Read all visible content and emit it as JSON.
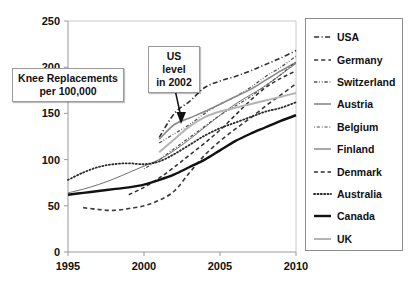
{
  "chart_data": {
    "type": "line",
    "title": "",
    "xlabel": "",
    "ylabel": "Knee Replacements per 100,000",
    "xlim": [
      1995,
      2010
    ],
    "ylim": [
      0,
      250
    ],
    "xticks": [
      "1995",
      "2000",
      "2005",
      "2010"
    ],
    "yticks": [
      "0",
      "50",
      "100",
      "150",
      "200",
      "250"
    ],
    "grid": false,
    "legend_position": "right",
    "x": [
      1995,
      1996,
      1997,
      1998,
      1999,
      2000,
      2001,
      2002,
      2003,
      2004,
      2005,
      2006,
      2007,
      2008,
      2009,
      2010
    ],
    "series": [
      {
        "name": "USA",
        "style": "dashdot",
        "width": 1.6,
        "color": "#303030",
        "values": [
          null,
          null,
          null,
          null,
          null,
          null,
          124,
          150,
          163,
          178,
          185,
          190,
          196,
          203,
          210,
          218
        ]
      },
      {
        "name": "Germany",
        "style": "dashed",
        "width": 1.6,
        "color": "#3a3a3a",
        "values": [
          null,
          48,
          46,
          45,
          47,
          50,
          56,
          66,
          86,
          105,
          120,
          133,
          145,
          158,
          170,
          182
        ]
      },
      {
        "name": "Switzerland",
        "style": "dashdotdot",
        "width": 1.3,
        "color": "#555555",
        "values": [
          null,
          null,
          null,
          null,
          null,
          null,
          118,
          128,
          138,
          150,
          160,
          168,
          178,
          190,
          200,
          212
        ]
      },
      {
        "name": "Austria",
        "style": "solid",
        "width": 1.6,
        "color": "#8a8a8a",
        "values": [
          null,
          null,
          null,
          null,
          null,
          null,
          122,
          138,
          145,
          152,
          160,
          168,
          176,
          186,
          196,
          205
        ]
      },
      {
        "name": "Belgium",
        "style": "dotdash",
        "width": 1.2,
        "color": "#4a4a4a",
        "values": [
          null,
          null,
          null,
          null,
          null,
          90,
          100,
          112,
          124,
          136,
          148,
          158,
          168,
          180,
          192,
          206
        ]
      },
      {
        "name": "Finland",
        "style": "solid",
        "width": 1.0,
        "color": "#6e6e6e",
        "values": [
          64,
          68,
          73,
          79,
          86,
          93,
          100,
          110,
          122,
          135,
          148,
          160,
          170,
          180,
          192,
          204
        ]
      },
      {
        "name": "Denmark",
        "style": "dashed",
        "width": 1.5,
        "color": "#2e2e2e",
        "values": [
          null,
          null,
          null,
          null,
          62,
          70,
          80,
          92,
          105,
          118,
          132,
          148,
          164,
          178,
          188,
          196
        ]
      },
      {
        "name": "Australia",
        "style": "dotted",
        "width": 1.8,
        "color": "#2a2a2a",
        "values": [
          78,
          86,
          92,
          95,
          96,
          95,
          98,
          106,
          116,
          126,
          134,
          140,
          146,
          152,
          156,
          162
        ]
      },
      {
        "name": "Canada",
        "style": "solid",
        "width": 2.4,
        "color": "#111111",
        "values": [
          62,
          64,
          66,
          68,
          70,
          73,
          78,
          84,
          92,
          100,
          110,
          120,
          128,
          135,
          142,
          148
        ]
      },
      {
        "name": "UK",
        "style": "solid",
        "width": 2.0,
        "color": "#b4b4b4",
        "values": [
          null,
          null,
          null,
          null,
          null,
          null,
          108,
          122,
          136,
          146,
          152,
          156,
          160,
          164,
          168,
          172
        ]
      }
    ],
    "annotations": [
      {
        "name": "axis-title",
        "text": "Knee Replacements\nper 100,000"
      },
      {
        "name": "us-level-callout",
        "text": "US level\nin 2002",
        "target_x": 2002,
        "target_y": 150
      }
    ]
  },
  "axis_title": {
    "line1": "Knee Replacements",
    "line2": "per 100,000"
  },
  "callout": {
    "line1": "US level",
    "line2": "in 2002"
  }
}
